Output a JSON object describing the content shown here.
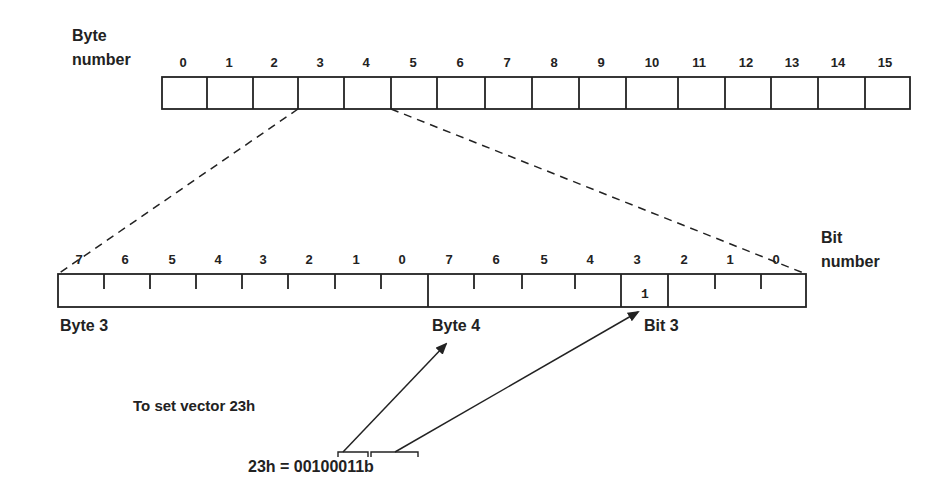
{
  "diagram": {
    "byte_axis_label_line1": "Byte",
    "byte_axis_label_line2": "number",
    "byte_numbers": [
      "0",
      "1",
      "2",
      "3",
      "4",
      "5",
      "6",
      "7",
      "8",
      "9",
      "10",
      "11",
      "12",
      "13",
      "14",
      "15"
    ],
    "bit_axis_label_line1": "Bit",
    "bit_axis_label_line2": "number",
    "byte3_bits": [
      "7",
      "6",
      "5",
      "4",
      "3",
      "2",
      "1",
      "0"
    ],
    "byte4_bits": [
      "7",
      "6",
      "5",
      "4",
      "3",
      "2",
      "1",
      "0"
    ],
    "set_bit_value": "1",
    "byte3_label": "Byte 3",
    "byte4_label": "Byte 4",
    "bit3_label": "Bit 3",
    "instruction": "To set vector 23h",
    "equation_prefix": "23h = ",
    "equation_binary": "00100011b",
    "colors": {
      "line": "#222222",
      "background": "#ffffff"
    }
  }
}
